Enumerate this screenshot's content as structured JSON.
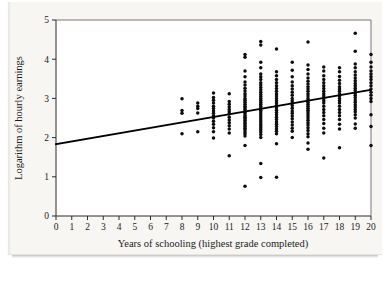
{
  "figure": {
    "background_color": "#f7f6f3",
    "plot_background_color": "#ffffff",
    "frame_color": "#777777",
    "point_color": "#0d0d0d",
    "line_color": "#000000"
  },
  "chart_data": {
    "type": "scatter",
    "title": "",
    "subtitle": "",
    "xlabel": "Years of schooling (highest grade completed)",
    "ylabel": "Logarithm of hourly earnings",
    "xlim": [
      0,
      20
    ],
    "ylim": [
      0,
      5
    ],
    "xticks": [
      0,
      1,
      2,
      3,
      4,
      5,
      6,
      7,
      8,
      9,
      10,
      11,
      12,
      13,
      14,
      15,
      16,
      17,
      18,
      19,
      20
    ],
    "yticks": [
      0,
      1,
      2,
      3,
      4,
      5
    ],
    "xtick_labels": [
      "0",
      "1",
      "2",
      "3",
      "4",
      "5",
      "6",
      "7",
      "8",
      "9",
      "10",
      "11",
      "12",
      "13",
      "14",
      "15",
      "16",
      "17",
      "18",
      "19",
      "20"
    ],
    "ytick_labels": [
      "0",
      "1",
      "2",
      "3",
      "4",
      "5"
    ],
    "grid": false,
    "legend": false,
    "legend_position": "none",
    "series": [
      {
        "name": "Observations",
        "type": "scatter",
        "marker": "circle",
        "x": [
          8,
          8,
          8,
          8,
          9,
          9,
          9,
          9,
          9,
          10,
          10,
          10,
          10,
          10,
          10,
          10,
          10,
          10,
          10,
          10,
          10,
          10,
          10,
          10,
          11,
          11,
          11,
          11,
          11,
          11,
          11,
          11,
          11,
          11,
          11,
          11,
          11,
          11,
          12,
          12,
          12,
          12,
          12,
          12,
          12,
          12,
          12,
          12,
          12,
          12,
          12,
          12,
          12,
          12,
          12,
          12,
          12,
          12,
          12,
          12,
          12,
          12,
          12,
          12,
          12,
          12,
          12,
          12,
          12,
          12,
          12,
          12,
          12,
          13,
          13,
          13,
          13,
          13,
          13,
          13,
          13,
          13,
          13,
          13,
          13,
          13,
          13,
          13,
          13,
          13,
          13,
          13,
          13,
          13,
          13,
          13,
          13,
          13,
          13,
          13,
          13,
          13,
          13,
          13,
          13,
          13,
          13,
          13,
          13,
          14,
          14,
          14,
          14,
          14,
          14,
          14,
          14,
          14,
          14,
          14,
          14,
          14,
          14,
          14,
          14,
          14,
          14,
          14,
          14,
          14,
          14,
          14,
          14,
          14,
          14,
          14,
          14,
          15,
          15,
          15,
          15,
          15,
          15,
          15,
          15,
          15,
          15,
          15,
          15,
          15,
          15,
          15,
          15,
          15,
          15,
          15,
          15,
          15,
          15,
          16,
          16,
          16,
          16,
          16,
          16,
          16,
          16,
          16,
          16,
          16,
          16,
          16,
          16,
          16,
          16,
          16,
          16,
          16,
          16,
          16,
          16,
          16,
          16,
          16,
          16,
          16,
          16,
          16,
          16,
          16,
          16,
          17,
          17,
          17,
          17,
          17,
          17,
          17,
          17,
          17,
          17,
          17,
          17,
          17,
          17,
          17,
          17,
          17,
          17,
          17,
          17,
          17,
          17,
          18,
          18,
          18,
          18,
          18,
          18,
          18,
          18,
          18,
          18,
          18,
          18,
          18,
          18,
          18,
          18,
          18,
          18,
          18,
          18,
          18,
          19,
          19,
          19,
          19,
          19,
          19,
          19,
          19,
          19,
          19,
          19,
          19,
          19,
          19,
          19,
          19,
          19,
          19,
          19,
          19,
          19,
          19,
          19,
          19,
          19,
          20,
          20,
          20,
          20,
          20,
          20,
          20,
          20,
          20,
          20,
          20,
          20,
          20,
          20,
          20,
          20,
          20
        ],
        "y": [
          2.99,
          2.69,
          2.62,
          2.1,
          2.88,
          2.8,
          2.74,
          2.63,
          2.15,
          3.14,
          3.02,
          2.95,
          2.88,
          2.8,
          2.74,
          2.68,
          2.62,
          2.56,
          2.5,
          2.42,
          2.34,
          2.25,
          2.15,
          1.99,
          3.12,
          2.92,
          2.85,
          2.78,
          2.72,
          2.66,
          2.6,
          2.52,
          2.45,
          2.38,
          2.3,
          2.22,
          2.12,
          1.54,
          4.12,
          4.05,
          3.7,
          3.55,
          3.42,
          3.34,
          3.26,
          3.19,
          3.12,
          3.06,
          3.0,
          2.95,
          2.9,
          2.85,
          2.8,
          2.76,
          2.72,
          2.68,
          2.64,
          2.6,
          2.56,
          2.52,
          2.48,
          2.44,
          2.4,
          2.36,
          2.32,
          2.28,
          2.24,
          2.2,
          2.15,
          2.1,
          2.04,
          1.8,
          0.76,
          4.45,
          4.36,
          3.92,
          3.78,
          3.62,
          3.55,
          3.48,
          3.4,
          3.34,
          3.28,
          3.22,
          3.16,
          3.1,
          3.05,
          3.0,
          2.95,
          2.9,
          2.85,
          2.8,
          2.75,
          2.7,
          2.65,
          2.6,
          2.55,
          2.5,
          2.45,
          2.4,
          2.35,
          2.3,
          2.25,
          2.2,
          2.14,
          2.08,
          2.0,
          1.34,
          0.98,
          4.26,
          3.68,
          3.58,
          3.48,
          3.4,
          3.32,
          3.25,
          3.18,
          3.12,
          3.06,
          3.0,
          2.94,
          2.88,
          2.82,
          2.76,
          2.7,
          2.64,
          2.58,
          2.52,
          2.46,
          2.4,
          2.34,
          2.28,
          2.22,
          2.16,
          2.1,
          1.84,
          0.99,
          3.92,
          3.72,
          3.55,
          3.42,
          3.32,
          3.24,
          3.16,
          3.08,
          3.0,
          2.94,
          2.88,
          2.82,
          2.75,
          2.68,
          2.62,
          2.55,
          2.48,
          2.4,
          2.32,
          2.24,
          2.16,
          2.0,
          4.44,
          3.85,
          3.74,
          3.62,
          3.52,
          3.44,
          3.37,
          3.3,
          3.24,
          3.18,
          3.12,
          3.06,
          3.0,
          2.95,
          2.9,
          2.85,
          2.8,
          2.75,
          2.7,
          2.65,
          2.6,
          2.55,
          2.5,
          2.44,
          2.38,
          2.32,
          2.25,
          2.18,
          2.1,
          2.02,
          1.86,
          1.7,
          3.8,
          3.7,
          3.58,
          3.48,
          3.4,
          3.32,
          3.25,
          3.18,
          3.12,
          3.06,
          3.0,
          2.94,
          2.88,
          2.8,
          2.72,
          2.64,
          2.56,
          2.46,
          2.36,
          2.24,
          2.12,
          1.48,
          3.78,
          3.68,
          3.56,
          3.46,
          3.38,
          3.3,
          3.24,
          3.18,
          3.12,
          3.06,
          3.0,
          2.94,
          2.88,
          2.8,
          2.72,
          2.64,
          2.56,
          2.46,
          2.34,
          2.22,
          1.74,
          4.66,
          4.2,
          3.88,
          3.78,
          3.68,
          3.6,
          3.52,
          3.45,
          3.38,
          3.32,
          3.26,
          3.2,
          3.14,
          3.08,
          3.02,
          2.96,
          2.9,
          2.84,
          2.78,
          2.72,
          2.66,
          2.58,
          2.5,
          2.35,
          2.24,
          4.12,
          3.92,
          3.8,
          3.7,
          3.62,
          3.55,
          3.48,
          3.4,
          3.32,
          3.24,
          3.16,
          3.08,
          3.0,
          2.92,
          2.58,
          2.28,
          1.8
        ]
      },
      {
        "name": "Fitted regression line",
        "type": "line",
        "x": [
          0,
          20
        ],
        "y": [
          1.83,
          3.22
        ],
        "slope": 0.0695,
        "intercept": 1.83
      }
    ]
  }
}
